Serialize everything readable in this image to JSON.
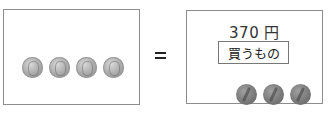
{
  "left": {
    "coins": [
      {
        "type": "silver-coin",
        "label": "100"
      },
      {
        "type": "silver-coin",
        "label": "100"
      },
      {
        "type": "silver-coin",
        "label": "100"
      },
      {
        "type": "silver-coin",
        "label": "100"
      }
    ]
  },
  "operator": "=",
  "right": {
    "price": "370 円",
    "item_label": "買うもの",
    "coins": [
      {
        "type": "dark-coin",
        "label": "10"
      },
      {
        "type": "dark-coin",
        "label": "10"
      },
      {
        "type": "dark-coin",
        "label": "10"
      }
    ]
  },
  "colors": {
    "border": "#8c8c8c",
    "silver_coin": "#a8a8a8",
    "dark_coin": "#7a7a7a",
    "text": "#333333"
  }
}
